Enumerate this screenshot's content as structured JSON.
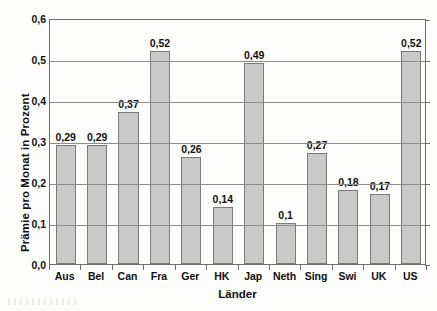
{
  "chart_data": {
    "type": "bar",
    "title": "",
    "xlabel": "Länder",
    "ylabel": "Prämie pro Monat in Prozent",
    "categories": [
      "Aus",
      "Bel",
      "Can",
      "Fra",
      "Ger",
      "HK",
      "Jap",
      "Neth",
      "Sing",
      "Swi",
      "UK",
      "US"
    ],
    "values": [
      0.29,
      0.29,
      0.37,
      0.52,
      0.26,
      0.14,
      0.49,
      0.1,
      0.27,
      0.18,
      0.17,
      0.52
    ],
    "value_labels": [
      "0,29",
      "0,29",
      "0,37",
      "0,52",
      "0,26",
      "0,14",
      "0,49",
      "0,1",
      "0,27",
      "0,18",
      "0,17",
      "0,52"
    ],
    "ylim": [
      0,
      0.6
    ],
    "ytick_values": [
      0.0,
      0.1,
      0.2,
      0.3,
      0.4,
      0.5,
      0.6
    ],
    "ytick_labels": [
      "0,0",
      "0,1",
      "0,2",
      "0,3",
      "0,4",
      "0,5",
      "0,6"
    ],
    "grid": "horizontal",
    "legend": "none",
    "decimal_separator": ",",
    "bar_fill_color": "#c9c9c9",
    "bar_border_color": "#7a7a7a",
    "grid_color": "#8d8d8d",
    "axis_color": "#6e6e6e",
    "background_color": "#fdfdfb",
    "text_color": "#111111"
  }
}
